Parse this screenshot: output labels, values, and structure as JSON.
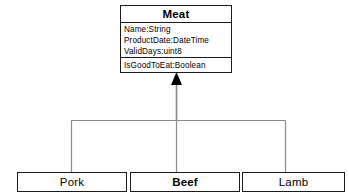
{
  "diagram": {
    "type": "uml-class-diagram",
    "relationship": "generalization",
    "colors": {
      "background": "#ffffff",
      "box_border": "#1a1a1a",
      "box_fill": "#ffffff",
      "connector_line": "#8a8a8a",
      "arrow_fill": "#000000",
      "text": "#000000"
    }
  },
  "superclass": {
    "name": "Meat",
    "attributes": [
      "Name:String",
      "ProductDate:DateTime",
      "ValidDays:uint8"
    ],
    "operations": [
      "IsGoodToEat:Boolean"
    ]
  },
  "subclasses": [
    {
      "name": "Pork",
      "bold": false
    },
    {
      "name": "Beef",
      "bold": true
    },
    {
      "name": "Lamb",
      "bold": false
    }
  ]
}
